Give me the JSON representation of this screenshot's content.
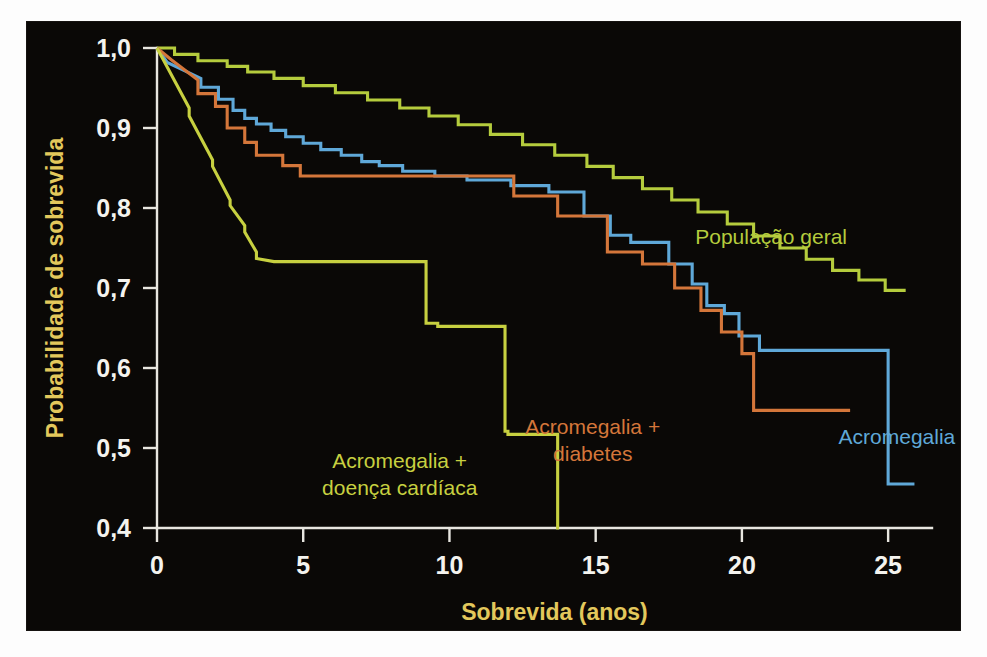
{
  "figure": {
    "background_color": "#0a0806",
    "page_background": "#fdfdfd"
  },
  "chart_data": {
    "type": "line",
    "subtype": "kaplan-meier-step",
    "title": "",
    "xlabel": "Sobrevida (anos)",
    "ylabel": "Probabilidade de sobrevida",
    "xlim": [
      0,
      26.5
    ],
    "ylim": [
      0.4,
      1.0
    ],
    "xticks": [
      0,
      5,
      10,
      15,
      20,
      25
    ],
    "xticklabels": [
      "0",
      "5",
      "10",
      "15",
      "20",
      "25"
    ],
    "yticks": [
      0.4,
      0.5,
      0.6,
      0.7,
      0.8,
      0.9,
      1.0
    ],
    "yticklabels": [
      "0,4",
      "0,5",
      "0,6",
      "0,7",
      "0,8",
      "0,9",
      "1,0"
    ],
    "grid": false,
    "legend_position": "inline-annotations",
    "tick_label_color": "#f4f3ee",
    "axis_title_color": "#e3c85c",
    "axis_line_color": "#e8e6e0",
    "series": [
      {
        "name": "População geral",
        "color": "#b5cc3d",
        "label": "População geral",
        "label_x": 21.0,
        "label_y": 0.755,
        "label_anchor": "middle",
        "x": [
          0.0,
          0.6,
          0.6,
          1.4,
          1.4,
          2.4,
          2.4,
          3.1,
          3.1,
          4.0,
          4.0,
          5.0,
          5.0,
          6.1,
          6.1,
          7.2,
          7.2,
          8.3,
          8.3,
          9.3,
          9.3,
          10.3,
          10.3,
          11.4,
          11.4,
          12.5,
          12.5,
          13.6,
          13.6,
          14.7,
          14.7,
          15.6,
          15.6,
          16.6,
          16.6,
          17.6,
          17.6,
          18.5,
          18.5,
          19.5,
          19.5,
          20.4,
          20.4,
          21.3,
          21.3,
          22.2,
          22.2,
          23.1,
          23.1,
          24.0,
          24.0,
          24.9,
          24.9,
          25.6
        ],
        "y": [
          1.0,
          1.0,
          0.992,
          0.992,
          0.984,
          0.984,
          0.977,
          0.977,
          0.97,
          0.97,
          0.962,
          0.962,
          0.953,
          0.953,
          0.944,
          0.944,
          0.935,
          0.935,
          0.925,
          0.925,
          0.915,
          0.915,
          0.904,
          0.904,
          0.892,
          0.892,
          0.879,
          0.879,
          0.866,
          0.866,
          0.852,
          0.852,
          0.838,
          0.838,
          0.824,
          0.824,
          0.81,
          0.81,
          0.795,
          0.795,
          0.78,
          0.78,
          0.765,
          0.765,
          0.75,
          0.75,
          0.736,
          0.736,
          0.722,
          0.722,
          0.71,
          0.71,
          0.697,
          0.697
        ]
      },
      {
        "name": "Acromegalia",
        "color": "#5fa8d8",
        "label": "Acromegalia",
        "label_x": 25.3,
        "label_y": 0.505,
        "label_anchor": "middle",
        "x": [
          0.0,
          0.35,
          1.5,
          1.5,
          2.1,
          2.1,
          2.6,
          2.6,
          3.0,
          3.0,
          3.4,
          3.4,
          3.9,
          3.9,
          4.4,
          4.4,
          5.0,
          5.0,
          5.6,
          5.6,
          6.3,
          6.3,
          7.0,
          7.0,
          7.6,
          7.6,
          8.4,
          8.4,
          9.5,
          9.5,
          10.6,
          10.6,
          12.1,
          12.1,
          13.4,
          13.4,
          14.6,
          14.6,
          15.5,
          15.5,
          16.2,
          16.2,
          17.5,
          17.5,
          18.3,
          18.3,
          18.8,
          18.8,
          19.4,
          19.4,
          19.9,
          19.9,
          20.6,
          20.6,
          25.0,
          25.0,
          25.9
        ],
        "y": [
          1.0,
          0.982,
          0.962,
          0.951,
          0.951,
          0.936,
          0.936,
          0.922,
          0.922,
          0.912,
          0.912,
          0.905,
          0.905,
          0.897,
          0.897,
          0.889,
          0.889,
          0.881,
          0.881,
          0.873,
          0.873,
          0.866,
          0.866,
          0.858,
          0.858,
          0.853,
          0.853,
          0.846,
          0.846,
          0.84,
          0.84,
          0.835,
          0.835,
          0.828,
          0.828,
          0.82,
          0.82,
          0.79,
          0.79,
          0.766,
          0.766,
          0.757,
          0.757,
          0.73,
          0.73,
          0.705,
          0.705,
          0.678,
          0.678,
          0.668,
          0.668,
          0.64,
          0.64,
          0.622,
          0.622,
          0.455,
          0.455
        ]
      },
      {
        "name": "Acromegalia + diabetes",
        "color": "#d4763a",
        "label_lines": [
          "Acromegalia +",
          "diabetes"
        ],
        "label_x": 14.9,
        "label_y": 0.517,
        "label_anchor": "middle",
        "x": [
          0.0,
          0.5,
          1.4,
          1.4,
          2.0,
          2.0,
          2.4,
          2.4,
          3.0,
          3.0,
          3.4,
          3.4,
          4.3,
          4.3,
          4.9,
          4.9,
          9.4,
          9.4,
          12.2,
          12.2,
          13.7,
          13.7,
          15.4,
          15.4,
          16.6,
          16.6,
          17.7,
          17.7,
          18.6,
          18.6,
          19.3,
          19.3,
          20.0,
          20.0,
          20.4,
          20.4,
          23.7
        ],
        "y": [
          1.0,
          0.985,
          0.96,
          0.943,
          0.943,
          0.927,
          0.927,
          0.9,
          0.9,
          0.882,
          0.882,
          0.866,
          0.866,
          0.853,
          0.853,
          0.84,
          0.84,
          0.84,
          0.84,
          0.815,
          0.815,
          0.79,
          0.79,
          0.745,
          0.745,
          0.73,
          0.73,
          0.7,
          0.7,
          0.672,
          0.672,
          0.645,
          0.645,
          0.618,
          0.618,
          0.547,
          0.547
        ]
      },
      {
        "name": "Acromegalia + doença cardíaca",
        "color": "#c7d040",
        "label_lines": [
          "Acromegalia +",
          "doença cardíaca"
        ],
        "label_x": 8.3,
        "label_y": 0.475,
        "label_anchor": "middle",
        "x": [
          0.0,
          1.1,
          1.1,
          1.9,
          1.9,
          2.5,
          2.5,
          3.0,
          3.0,
          3.4,
          3.4,
          4.0,
          4.0,
          9.2,
          9.2,
          9.6,
          9.6,
          11.9,
          11.9,
          12.0,
          12.0,
          13.7,
          13.7,
          13.75
        ],
        "y": [
          1.0,
          0.925,
          0.915,
          0.86,
          0.852,
          0.81,
          0.803,
          0.778,
          0.77,
          0.745,
          0.737,
          0.733,
          0.733,
          0.733,
          0.656,
          0.656,
          0.652,
          0.652,
          0.521,
          0.521,
          0.517,
          0.517,
          0.4,
          0.4
        ]
      }
    ]
  }
}
